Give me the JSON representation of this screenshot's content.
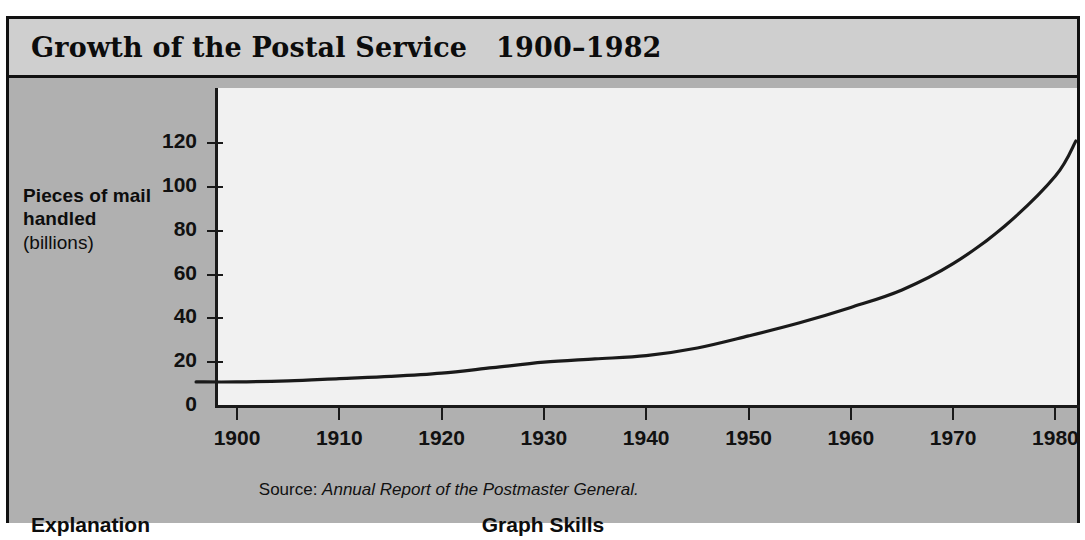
{
  "title": "Growth of the Postal Service   1900–1982",
  "axis_title": {
    "line1": "Pieces of mail\nhandled",
    "line2": "(billions)"
  },
  "source": {
    "label": "Source: ",
    "citation": "Annual Report of the Postmaster General."
  },
  "footer": {
    "left_label": "Explanation",
    "center_label": "Graph Skills"
  },
  "colors": {
    "page_background": "#ffffff",
    "panel_background": "#b0b0b0",
    "title_band": "#cfcfcf",
    "plot_background": "#f1f1f1",
    "ink": "#111111",
    "curve": "#1a1a1a"
  },
  "chart_data": {
    "type": "line",
    "title": "Growth of the Postal Service   1900–1982",
    "xlabel": "",
    "ylabel": "Pieces of mail handled (billions)",
    "xlim": [
      1896,
      1983
    ],
    "ylim": [
      0,
      128
    ],
    "grid": false,
    "legend": null,
    "ytick_labels": [
      "0",
      "20",
      "40",
      "60",
      "80",
      "100",
      "120"
    ],
    "ytick_values": [
      0,
      20,
      40,
      60,
      80,
      100,
      120
    ],
    "xtick_labels": [
      "1900",
      "1910",
      "1920",
      "1930",
      "1940",
      "1950",
      "1960",
      "1970",
      "1980"
    ],
    "xtick_values": [
      1900,
      1910,
      1920,
      1930,
      1940,
      1950,
      1960,
      1970,
      1980
    ],
    "series": [
      {
        "name": "Pieces of mail handled",
        "x": [
          1896,
          1900,
          1905,
          1910,
          1915,
          1920,
          1925,
          1930,
          1935,
          1940,
          1945,
          1950,
          1955,
          1960,
          1965,
          1970,
          1975,
          1980,
          1982
        ],
        "values": [
          11,
          11,
          11.5,
          12.5,
          13.5,
          15,
          17.5,
          20,
          21.5,
          23,
          26.5,
          32,
          38,
          45,
          53,
          65,
          82,
          105,
          121
        ]
      }
    ]
  }
}
